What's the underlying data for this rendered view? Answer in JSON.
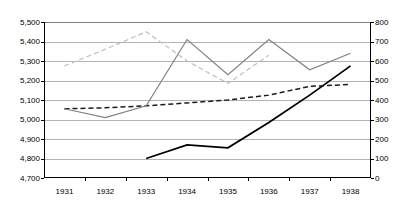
{
  "chart_data": {
    "type": "line",
    "title": "",
    "subtitle": "",
    "xlabel": "",
    "ylabel": "",
    "categories": [
      "1931",
      "1932",
      "1933",
      "1934",
      "1935",
      "1936",
      "1937",
      "1938"
    ],
    "axes": {
      "left": {
        "label": "",
        "ylim": [
          4700,
          5500
        ],
        "tick_step": 100,
        "ticks": [
          "4,700",
          "4,800",
          "4,900",
          "5,000",
          "5,100",
          "5,200",
          "5,300",
          "5,400",
          "5,500"
        ],
        "tick_values": [
          4700,
          4800,
          4900,
          5000,
          5100,
          5200,
          5300,
          5400,
          5500
        ]
      },
      "right": {
        "label": "",
        "ylim": [
          0,
          800
        ],
        "tick_step": 100,
        "ticks": [
          "0",
          "100",
          "200",
          "300",
          "400",
          "500",
          "600",
          "700",
          "800"
        ],
        "tick_values": [
          0,
          100,
          200,
          300,
          400,
          500,
          600,
          700,
          800
        ]
      }
    },
    "grid": true,
    "legend": null,
    "legend_position": "none",
    "series": [
      {
        "name": "series-1-solid-dark",
        "axis": "left",
        "style": "solid",
        "color": "#000000",
        "width": 1.8,
        "x": [
          "1933",
          "1934",
          "1935",
          "1936",
          "1937",
          "1938"
        ],
        "values": [
          4800,
          4870,
          4855,
          4985,
          5125,
          5275
        ]
      },
      {
        "name": "series-2-dashed-dark",
        "axis": "left",
        "style": "dashed",
        "color": "#1a1a1a",
        "width": 1.5,
        "x": [
          "1931",
          "1932",
          "1933",
          "1934",
          "1935",
          "1936",
          "1937",
          "1938"
        ],
        "values": [
          5055,
          5060,
          5070,
          5085,
          5100,
          5125,
          5170,
          5180
        ]
      },
      {
        "name": "series-3-solid-gray",
        "axis": "left",
        "style": "solid",
        "color": "#808080",
        "width": 1.2,
        "x": [
          "1931",
          "1932",
          "1933",
          "1934",
          "1935",
          "1936",
          "1937",
          "1938"
        ],
        "values": [
          5055,
          5010,
          5070,
          5410,
          5230,
          5410,
          5255,
          5340
        ]
      },
      {
        "name": "series-4-dashed-light-gray",
        "axis": "left",
        "style": "dashed",
        "color": "#bfbfbf",
        "width": 1.2,
        "x": [
          "1931",
          "1932",
          "1933",
          "1934",
          "1935",
          "1936"
        ],
        "values": [
          5275,
          5360,
          5450,
          5300,
          5185,
          5330
        ]
      }
    ]
  }
}
